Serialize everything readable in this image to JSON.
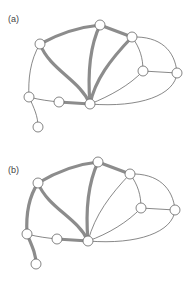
{
  "panels": [
    {
      "label": "(a)",
      "label_pos": [
        8,
        14
      ],
      "nodes": {
        "A": [
          40,
          44
        ],
        "B": [
          100,
          25
        ],
        "C": [
          132,
          37
        ],
        "D": [
          143,
          71
        ],
        "E": [
          177,
          73
        ],
        "F": [
          29,
          97
        ],
        "G": [
          59,
          102
        ],
        "H": [
          90,
          104
        ],
        "I": [
          38,
          127
        ]
      },
      "thin_edges": [
        {
          "d": "M132,37 C160,36 175,50 177,73"
        },
        {
          "d": "M132,37 C140,48 143,58 143,71"
        },
        {
          "d": "M143,71 L177,73"
        },
        {
          "d": "M143,71 C130,85 110,96 90,104"
        },
        {
          "d": "M177,73 C175,95 140,108 90,104"
        },
        {
          "d": "M40,44 C30,60 28,80 29,97"
        },
        {
          "d": "M29,97 C40,100 50,101 59,102"
        },
        {
          "d": "M29,97 C34,108 38,116 38,127"
        }
      ],
      "thick_edges": [
        {
          "d": "M40,44 C60,33 80,27 100,25"
        },
        {
          "d": "M100,25 L132,37"
        },
        {
          "d": "M40,44 C50,70 80,80 90,104"
        },
        {
          "d": "M100,25 C88,50 88,80 90,104"
        },
        {
          "d": "M132,37 C110,60 95,80 90,104"
        },
        {
          "d": "M59,102 L90,104"
        }
      ]
    },
    {
      "label": "(b)",
      "label_pos": [
        8,
        165
      ],
      "nodes": {
        "A": [
          38,
          183
        ],
        "B": [
          98,
          162
        ],
        "C": [
          130,
          174
        ],
        "D": [
          141,
          208
        ],
        "E": [
          175,
          210
        ],
        "F": [
          27,
          234
        ],
        "G": [
          57,
          239
        ],
        "H": [
          88,
          241
        ],
        "I": [
          36,
          264
        ]
      },
      "thin_edges": [
        {
          "d": "M130,174 C158,173 173,188 175,210"
        },
        {
          "d": "M130,174 C138,185 141,195 141,208"
        },
        {
          "d": "M141,208 L175,210"
        },
        {
          "d": "M141,208 C128,222 108,234 88,241"
        },
        {
          "d": "M175,210 C173,232 138,245 88,241"
        },
        {
          "d": "M130,174 C110,195 95,215 88,241"
        },
        {
          "d": "M27,234 C38,237 48,238 57,239"
        }
      ],
      "thick_edges": [
        {
          "d": "M38,183 C58,171 78,164 98,162"
        },
        {
          "d": "M98,162 L130,174"
        },
        {
          "d": "M38,183 C48,208 78,218 88,241"
        },
        {
          "d": "M98,162 C86,188 86,218 88,241"
        },
        {
          "d": "M57,239 L88,241"
        },
        {
          "d": "M38,183 C28,198 26,218 27,234"
        },
        {
          "d": "M27,234 C32,246 36,254 36,264"
        }
      ]
    }
  ],
  "colors": {
    "thin_edge": "#555555",
    "thick_edge": "#8c8c8c",
    "node_fill": "#ffffff",
    "node_stroke": "#666666"
  }
}
